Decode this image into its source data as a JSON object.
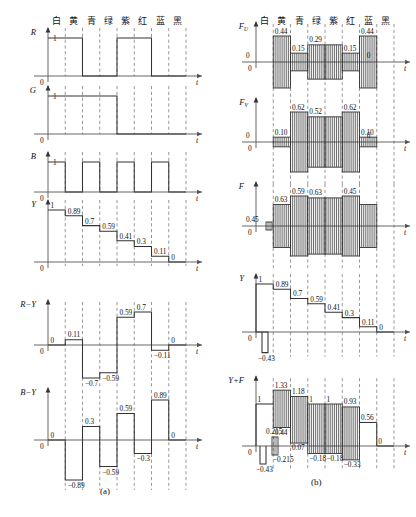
{
  "figure": {
    "color_bars": [
      "白",
      "黄",
      "青",
      "绿",
      "紫",
      "红",
      "蓝",
      "黑"
    ],
    "panel_a_caption": "(a)",
    "panel_b_caption": "(b)",
    "time_axis_label": "t",
    "zero_label": "0",
    "unity_label": "1"
  },
  "chart_data": {
    "type": "line",
    "xlabel": "t",
    "categories": [
      "白",
      "黄",
      "青",
      "绿",
      "紫",
      "红",
      "蓝",
      "黑"
    ],
    "panels": [
      {
        "name": "(a)",
        "signals": [
          {
            "label": "R",
            "type": "step",
            "values": [
              1,
              1,
              0,
              0,
              1,
              1,
              0,
              0
            ],
            "tick_labels": [
              "1",
              "0"
            ],
            "ylim": [
              0,
              1
            ]
          },
          {
            "label": "G",
            "type": "step",
            "values": [
              1,
              1,
              1,
              1,
              0,
              0,
              0,
              0
            ],
            "tick_labels": [
              "1",
              "0"
            ],
            "ylim": [
              0,
              1
            ]
          },
          {
            "label": "B",
            "type": "step",
            "values": [
              1,
              0,
              1,
              0,
              1,
              0,
              1,
              0
            ],
            "tick_labels": [
              "1",
              "0"
            ],
            "ylim": [
              0,
              1
            ]
          },
          {
            "label": "Y",
            "type": "staircase",
            "values": [
              1,
              0.89,
              0.7,
              0.59,
              0.41,
              0.3,
              0.11,
              0
            ],
            "data_labels": [
              "1",
              "0.89",
              "0.7",
              "0.59",
              "0.41",
              "0.3",
              "0.11",
              "0"
            ],
            "ylim": [
              0,
              1
            ]
          },
          {
            "label": "R−Y",
            "type": "step",
            "values": [
              0,
              0.11,
              -0.7,
              -0.59,
              0.59,
              0.7,
              -0.11,
              0
            ],
            "data_labels": [
              "0",
              "0.11",
              "−0.7",
              "−0.59",
              "0.59",
              "0.7",
              "−0.11",
              "0"
            ],
            "ylim": [
              -0.7,
              0.7
            ]
          },
          {
            "label": "B−Y",
            "type": "step",
            "values": [
              0,
              -0.89,
              0.3,
              -0.59,
              0.59,
              -0.3,
              0.89,
              0
            ],
            "data_labels": [
              "0",
              "−0.89",
              "0.3",
              "−0.59",
              "0.59",
              "−0.3",
              "0.89",
              "0"
            ],
            "ylim": [
              -0.89,
              0.89
            ]
          }
        ]
      },
      {
        "name": "(b)",
        "signals": [
          {
            "label": "FU",
            "label_base": "F",
            "label_sub": "U",
            "type": "modulated",
            "amplitudes": [
              0,
              0.44,
              0.15,
              0.29,
              0.29,
              0.15,
              0.44,
              0
            ],
            "data_labels": [
              "0",
              "0.44",
              "0.15",
              "0.29",
              "0.15",
              "0.44",
              "0"
            ],
            "ylim": [
              -0.44,
              0.44
            ]
          },
          {
            "label": "FV",
            "label_base": "F",
            "label_sub": "V",
            "type": "modulated",
            "amplitudes": [
              0,
              0.1,
              0.62,
              0.52,
              0.52,
              0.62,
              0.1,
              0
            ],
            "data_labels": [
              "0",
              "0.10",
              "0.62",
              "0.52",
              "0.62",
              "0.10",
              "0"
            ],
            "ylim": [
              -0.62,
              0.62
            ]
          },
          {
            "label": "F",
            "type": "modulated",
            "amplitudes": [
              0,
              0.45,
              0.63,
              0.59,
              0.59,
              0.63,
              0.45,
              0
            ],
            "data_labels": [
              "0.45",
              "0.63",
              "0.59",
              "0.63",
              "0.45"
            ],
            "burst": true,
            "ylim": [
              -0.63,
              0.63
            ]
          },
          {
            "label": "Y",
            "type": "staircase",
            "sync_level": -0.43,
            "sync_label": "−0.43",
            "values": [
              1,
              0.89,
              0.7,
              0.59,
              0.41,
              0.3,
              0.11,
              0
            ],
            "data_labels": [
              "1",
              "0.89",
              "0.7",
              "0.59",
              "0.41",
              "0.3",
              "0.11",
              "0"
            ],
            "ylim": [
              -0.43,
              1
            ]
          },
          {
            "label": "Y+F",
            "type": "composite",
            "sync_level": -0.43,
            "sync_label": "−0.43",
            "burst_top": 0.215,
            "burst_bottom": -0.215,
            "burst_top_label": "0.215",
            "burst_bottom_label": "−0.215",
            "segments": [
              {
                "bar": "白",
                "top": 1,
                "bottom": 1,
                "top_label": "1",
                "bottom_label": ""
              },
              {
                "bar": "黄",
                "top": 1.33,
                "bottom": 0.44,
                "top_label": "1.33",
                "bottom_label": "0.44"
              },
              {
                "bar": "青",
                "top": 1.18,
                "bottom": 0.07,
                "top_label": "1.18",
                "bottom_label": "0.07"
              },
              {
                "bar": "绿",
                "top": 1,
                "bottom": -0.18,
                "top_label": "1",
                "bottom_label": "−0.18"
              },
              {
                "bar": "紫",
                "top": 1,
                "bottom": -0.18,
                "top_label": "1",
                "bottom_label": "−0.18"
              },
              {
                "bar": "红",
                "top": 0.93,
                "bottom": -0.33,
                "top_label": "0.93",
                "bottom_label": "−0.33"
              },
              {
                "bar": "蓝",
                "top": 0.56,
                "bottom": 0.56,
                "top_label": "0.56",
                "bottom_label": ""
              },
              {
                "bar": "黑",
                "top": 0,
                "bottom": 0,
                "top_label": "0",
                "bottom_label": ""
              }
            ],
            "ylim": [
              -0.43,
              1.33
            ]
          }
        ]
      }
    ]
  }
}
